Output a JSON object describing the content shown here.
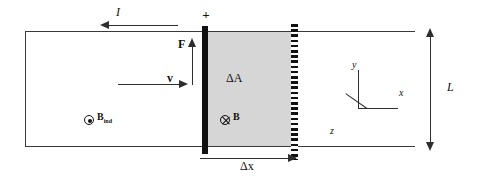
{
  "figure": {
    "labels": {
      "current": "I",
      "force": "F",
      "velocity": "v",
      "delta_area": "ΔA",
      "length": "L",
      "delta_x": "Δx",
      "field_into_page": "B",
      "field_induced_base": "B",
      "field_induced_subscript": "ind",
      "axis_x": "x",
      "axis_y": "y",
      "axis_z": "z",
      "terminal_positive": "+",
      "terminal_negative": "−"
    },
    "symbols": {
      "into_page_icon": "cross-in-circle-icon",
      "out_of_page_icon": "dot-in-circle-icon"
    },
    "colors": {
      "outline": "#3a3a3a",
      "arrow": "#2e2e2e",
      "bar": "#111111",
      "swept_area_fill": "#d6d6d6",
      "background": "#ffffff"
    }
  }
}
